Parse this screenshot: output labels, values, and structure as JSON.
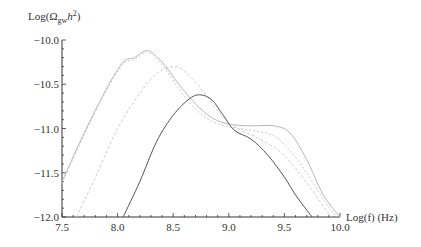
{
  "chart_data": {
    "type": "line",
    "title": "",
    "xlabel": "Log(f) (Hz)",
    "ylabel": "Log(Ω_gw h²)",
    "ylabel_parts": {
      "base": "Log(Ω",
      "sub": "gw",
      "mid": "h",
      "sup": "2",
      "end": ")"
    },
    "xlim": [
      7.5,
      10.0
    ],
    "ylim": [
      -12.0,
      -10.0
    ],
    "x_ticks": [
      "7.5",
      "8.0",
      "8.5",
      "9.0",
      "9.5",
      "10.0"
    ],
    "x_tick_values": [
      7.5,
      8.0,
      8.5,
      9.0,
      9.5,
      10.0
    ],
    "y_ticks": [
      "-10.0",
      "-10.5",
      "-11.0",
      "-11.5",
      "-12.0"
    ],
    "y_tick_values": [
      -10.0,
      -10.5,
      -11.0,
      -11.5,
      -12.0
    ],
    "grid": false,
    "legend": null,
    "series": [
      {
        "name": "curve-1-light-high",
        "color": "#b8b8b8",
        "dash": "",
        "x": [
          7.5,
          7.7,
          7.9,
          8.05,
          8.15,
          8.27,
          8.4,
          8.55,
          8.7,
          8.85,
          9.0,
          9.2,
          9.4,
          9.55,
          9.7,
          9.85,
          10.0
        ],
        "y": [
          -11.6,
          -11.05,
          -10.55,
          -10.25,
          -10.2,
          -10.12,
          -10.25,
          -10.5,
          -10.72,
          -10.88,
          -10.95,
          -10.97,
          -10.97,
          -11.05,
          -11.35,
          -11.75,
          -12.0
        ]
      },
      {
        "name": "curve-2-light-high-dotted",
        "color": "#c8c8c8",
        "dash": "2,2",
        "x": [
          7.5,
          7.7,
          7.9,
          8.05,
          8.15,
          8.27,
          8.4,
          8.55,
          8.7,
          8.85,
          9.0,
          9.2,
          9.4,
          9.55,
          9.7,
          9.85,
          9.97
        ],
        "y": [
          -11.62,
          -11.07,
          -10.57,
          -10.27,
          -10.22,
          -10.14,
          -10.28,
          -10.55,
          -10.78,
          -10.92,
          -10.98,
          -11.02,
          -11.08,
          -11.25,
          -11.5,
          -11.8,
          -12.0
        ]
      },
      {
        "name": "curve-3-light-mid-dashed",
        "color": "#cfcfcf",
        "dash": "3,2",
        "x": [
          7.63,
          7.8,
          8.0,
          8.2,
          8.35,
          8.5,
          8.6,
          8.75,
          8.9,
          9.05,
          9.25,
          9.45,
          9.6,
          9.75,
          9.92
        ],
        "y": [
          -12.0,
          -11.55,
          -11.0,
          -10.6,
          -10.38,
          -10.3,
          -10.35,
          -10.55,
          -10.8,
          -10.98,
          -11.1,
          -11.25,
          -11.45,
          -11.7,
          -12.0
        ]
      },
      {
        "name": "curve-4-dark-solid",
        "color": "#555555",
        "dash": "",
        "x": [
          8.05,
          8.2,
          8.35,
          8.5,
          8.65,
          8.75,
          8.85,
          8.95,
          9.05,
          9.2,
          9.35,
          9.5,
          9.6,
          9.7,
          9.75
        ],
        "y": [
          -12.0,
          -11.6,
          -11.15,
          -10.85,
          -10.66,
          -10.62,
          -10.68,
          -10.85,
          -11.02,
          -11.12,
          -11.3,
          -11.55,
          -11.75,
          -11.92,
          -12.0
        ]
      }
    ]
  }
}
